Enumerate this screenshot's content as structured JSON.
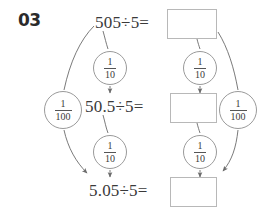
{
  "problem": {
    "number": "03",
    "type": "division-place-value-chain"
  },
  "equations": [
    {
      "id": "eq1",
      "text": "505÷5=",
      "dividend": "505",
      "divisor": "5",
      "answer": ""
    },
    {
      "id": "eq2",
      "text": "50.5÷5=",
      "dividend": "50.5",
      "divisor": "5",
      "answer": ""
    },
    {
      "id": "eq3",
      "text": "5.05÷5=",
      "dividend": "5.05",
      "divisor": "5",
      "answer": ""
    }
  ],
  "answer_boxes": [
    {
      "id": "box1",
      "value": ""
    },
    {
      "id": "box2",
      "value": ""
    },
    {
      "id": "box3",
      "value": ""
    }
  ],
  "factor_circles": [
    {
      "id": "left-top-tenth",
      "numerator": "1",
      "denominator": "10"
    },
    {
      "id": "left-bottom-tenth",
      "numerator": "1",
      "denominator": "10"
    },
    {
      "id": "right-top-tenth",
      "numerator": "1",
      "denominator": "10"
    },
    {
      "id": "right-bottom-tenth",
      "numerator": "1",
      "denominator": "10"
    },
    {
      "id": "left-hundredth",
      "numerator": "1",
      "denominator": "100"
    },
    {
      "id": "right-hundredth",
      "numerator": "1",
      "denominator": "100"
    }
  ],
  "colors": {
    "text": "#3a3a3a",
    "number_label": "#2b2b2b",
    "box_border": "#b8b8b8",
    "circle_border": "#9a9a9a",
    "arrow": "#6b6b6b",
    "background": "#ffffff"
  }
}
